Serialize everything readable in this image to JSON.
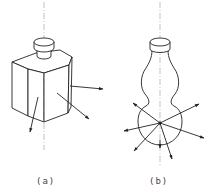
{
  "figure": {
    "panels": [
      {
        "id": "a",
        "label": "(a)",
        "description": "Hexagonal prism bottle with cap; arrows normal to flat faces",
        "arrow_count": 3
      },
      {
        "id": "b",
        "label": "(b)",
        "description": "Gourd-shaped bottle with cap; arrows radiating from center of lower spherical bulb",
        "arrow_count": 8
      }
    ],
    "colors": {
      "stroke": "#222222",
      "axis": "#888888",
      "background": "#ffffff"
    }
  }
}
